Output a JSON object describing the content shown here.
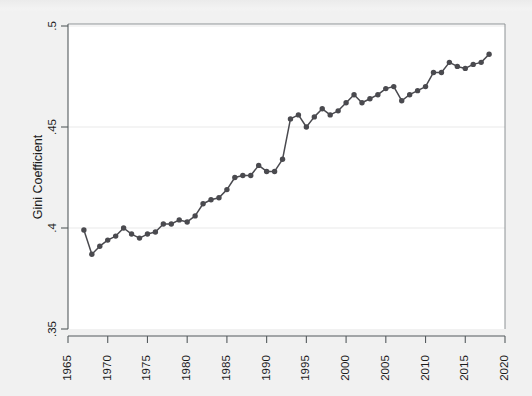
{
  "figure": {
    "title": "",
    "background_color": "#f1f1f1",
    "plot_background_color": "#ffffff",
    "series_color": "#4a4a4f",
    "axis_color": "#555b5e"
  },
  "chart_data": {
    "type": "line",
    "title": "",
    "subtitle": "",
    "xlabel": "",
    "ylabel": "Gini Coefficient",
    "xlim": [
      1965,
      2020
    ],
    "ylim": [
      0.35,
      0.5
    ],
    "xticks": [
      1965,
      1970,
      1975,
      1980,
      1985,
      1990,
      1995,
      2000,
      2005,
      2010,
      2015,
      2020
    ],
    "xtick_labels": [
      "1965",
      "1970",
      "1975",
      "1980",
      "1985",
      "1990",
      "1995",
      "2000",
      "2005",
      "2010",
      "2015",
      "2020"
    ],
    "yticks": [
      0.35,
      0.4,
      0.45,
      0.5
    ],
    "ytick_labels": [
      ".35",
      ".4",
      ".45",
      ".5"
    ],
    "grid": false,
    "legend": false,
    "legend_position": "none",
    "marker": "circle",
    "markers_visible": true,
    "series": [
      {
        "name": "Gini Coefficient",
        "color": "#4a4a4f",
        "x": [
          1967,
          1968,
          1969,
          1970,
          1971,
          1972,
          1973,
          1974,
          1975,
          1976,
          1977,
          1978,
          1979,
          1980,
          1981,
          1982,
          1983,
          1984,
          1985,
          1986,
          1987,
          1988,
          1989,
          1990,
          1991,
          1992,
          1993,
          1994,
          1995,
          1996,
          1997,
          1998,
          1999,
          2000,
          2001,
          2002,
          2003,
          2004,
          2005,
          2006,
          2007,
          2008,
          2009,
          2010,
          2011,
          2012,
          2013,
          2014,
          2015,
          2016,
          2017,
          2018
        ],
        "values": [
          0.399,
          0.387,
          0.391,
          0.394,
          0.396,
          0.4,
          0.397,
          0.395,
          0.397,
          0.398,
          0.402,
          0.402,
          0.404,
          0.403,
          0.406,
          0.412,
          0.414,
          0.415,
          0.419,
          0.425,
          0.426,
          0.426,
          0.431,
          0.428,
          0.428,
          0.434,
          0.454,
          0.456,
          0.45,
          0.455,
          0.459,
          0.456,
          0.458,
          0.462,
          0.466,
          0.462,
          0.464,
          0.466,
          0.469,
          0.47,
          0.463,
          0.466,
          0.468,
          0.47,
          0.477,
          0.477,
          0.482,
          0.48,
          0.479,
          0.481,
          0.482,
          0.486
        ]
      }
    ]
  },
  "axes": {
    "y_title": "Gini Coefficient"
  }
}
